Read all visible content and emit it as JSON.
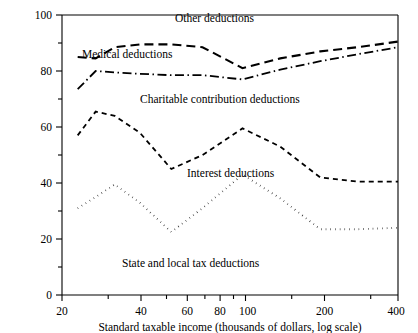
{
  "chart_data": {
    "type": "line",
    "title": "",
    "xlabel": "Standard taxable income (thousands of dollars, log scale)",
    "ylabel": "",
    "xscale": "log",
    "xlim": [
      20,
      400
    ],
    "ylim": [
      0,
      100
    ],
    "grid": false,
    "legend_position": "inline-annotations",
    "x_major_ticks": [
      20,
      40,
      60,
      80,
      100,
      200,
      400
    ],
    "x_major_tick_labels": [
      "20",
      "40",
      "60",
      "80",
      "100",
      "200",
      "400"
    ],
    "x_minor_ticks": [
      30,
      50,
      70,
      90,
      150,
      300
    ],
    "y_major_ticks": [
      0,
      20,
      40,
      60,
      80,
      100
    ],
    "y_major_tick_labels": [
      "0",
      "20",
      "40",
      "60",
      "80",
      "100"
    ],
    "y_minor_ticks": [
      10,
      30,
      50,
      70,
      90
    ],
    "x": [
      23,
      27,
      32,
      40,
      53,
      70,
      100,
      140,
      200,
      280,
      400
    ],
    "series": [
      {
        "name": "Other deductions",
        "dash_style": "long-dash",
        "values": [
          85,
          84.5,
          88.5,
          89.5,
          89.5,
          88.5,
          81,
          84.5,
          87,
          88.5,
          90.5
        ]
      },
      {
        "name": "Medical deductions",
        "dash_style": "dash-dot",
        "values": [
          73.5,
          80,
          79.5,
          79,
          78.5,
          78.5,
          77,
          80.5,
          83.5,
          86,
          88.5
        ]
      },
      {
        "name": "Charitable contribution deductions",
        "dash_style": "dash",
        "values": [
          57,
          65.5,
          64,
          58,
          45,
          50,
          59.5,
          53,
          42,
          40.5,
          40.5
        ]
      },
      {
        "name": "State and local tax deductions",
        "dash_style": "dot",
        "values": [
          31,
          35,
          39.5,
          33,
          22.5,
          31,
          43,
          34.5,
          23.5,
          23.5,
          24
        ]
      }
    ],
    "annotations": [
      {
        "text": "Other deductions",
        "x_px": 175,
        "y_px": 22
      },
      {
        "text": "Medical deductions",
        "x_px": 82,
        "y_px": 58
      },
      {
        "text": "Charitable contribution deductions",
        "x_px": 140,
        "y_px": 103
      },
      {
        "text": "Interest deductions",
        "x_px": 187,
        "y_px": 177
      },
      {
        "text": "State and local tax deductions",
        "x_px": 122,
        "y_px": 267
      }
    ]
  }
}
